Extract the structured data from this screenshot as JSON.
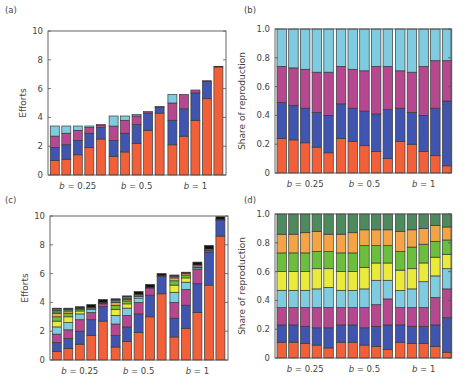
{
  "colors": [
    "#f2603a",
    "#3f55b0",
    "#b5488f",
    "#7fcbe0",
    "#eaea3a",
    "#6cbf3c",
    "#f5a445",
    "#4f8a5e",
    "#8a8a8a",
    "#111111"
  ],
  "chart_data": [
    {
      "id": "a",
      "panel_label": "(a)",
      "type": "bar",
      "stacked": true,
      "ylabel": "Efforts",
      "ylim": [
        0,
        10
      ],
      "yticks": [
        0,
        2,
        4,
        6,
        8,
        10
      ],
      "groups": [
        "b = 0.25",
        "b = 0.5",
        "b = 1"
      ],
      "bars_per_group": 5,
      "layers": 4,
      "values": [
        [
          [
            1.0,
            0.9,
            0.8,
            0.7
          ],
          [
            1.1,
            1.0,
            0.8,
            0.5
          ],
          [
            1.4,
            1.0,
            0.7,
            0.3
          ],
          [
            1.9,
            1.0,
            0.4,
            0.1
          ],
          [
            2.5,
            0.8,
            0.15,
            0.05
          ]
        ],
        [
          [
            1.3,
            1.1,
            1.0,
            0.7
          ],
          [
            1.6,
            1.3,
            0.9,
            0.3
          ],
          [
            2.2,
            1.3,
            0.6,
            0.1
          ],
          [
            3.1,
            1.2,
            0.1,
            0.0
          ],
          [
            4.3,
            0.4,
            0.05,
            0.0
          ]
        ],
        [
          [
            2.1,
            1.7,
            1.2,
            0.6
          ],
          [
            2.7,
            1.9,
            1.0,
            0.0
          ],
          [
            3.8,
            1.9,
            0.2,
            0.0
          ],
          [
            5.3,
            1.2,
            0.05,
            0.0
          ],
          [
            7.5,
            0.05,
            0.0,
            0.0
          ]
        ]
      ]
    },
    {
      "id": "b",
      "panel_label": "(b)",
      "type": "bar",
      "stacked": true,
      "ylabel": "Share of reproduction",
      "ylim": [
        0,
        1
      ],
      "yticks": [
        0,
        0.2,
        0.4,
        0.6,
        0.8,
        1.0
      ],
      "groups": [
        "b = 0.25",
        "b = 0.5",
        "b = 1"
      ],
      "bars_per_group": 5,
      "layers": 4,
      "values": [
        [
          [
            0.24,
            0.25,
            0.25,
            0.26
          ],
          [
            0.23,
            0.24,
            0.26,
            0.27
          ],
          [
            0.21,
            0.24,
            0.27,
            0.28
          ],
          [
            0.18,
            0.24,
            0.28,
            0.3
          ],
          [
            0.14,
            0.26,
            0.3,
            0.3
          ]
        ],
        [
          [
            0.24,
            0.24,
            0.26,
            0.26
          ],
          [
            0.22,
            0.23,
            0.27,
            0.28
          ],
          [
            0.19,
            0.24,
            0.28,
            0.29
          ],
          [
            0.15,
            0.26,
            0.33,
            0.26
          ],
          [
            0.1,
            0.34,
            0.3,
            0.26
          ]
        ],
        [
          [
            0.22,
            0.23,
            0.26,
            0.29
          ],
          [
            0.2,
            0.22,
            0.28,
            0.3
          ],
          [
            0.15,
            0.25,
            0.34,
            0.26
          ],
          [
            0.12,
            0.33,
            0.33,
            0.22
          ],
          [
            0.05,
            0.45,
            0.28,
            0.22
          ]
        ]
      ]
    },
    {
      "id": "c",
      "panel_label": "(c)",
      "type": "bar",
      "stacked": true,
      "ylabel": "Efforts",
      "ylim": [
        0,
        10
      ],
      "yticks": [
        0,
        2,
        4,
        6,
        8,
        10
      ],
      "groups": [
        "b = 0.25",
        "b = 0.5",
        "b = 1"
      ],
      "bars_per_group": 5,
      "layers": 10,
      "values": [
        [
          [
            0.6,
            0.6,
            0.6,
            0.5,
            0.4,
            0.3,
            0.25,
            0.2,
            0.1,
            0.05
          ],
          [
            0.8,
            0.7,
            0.6,
            0.5,
            0.4,
            0.25,
            0.15,
            0.1,
            0.05,
            0.05
          ],
          [
            1.1,
            0.9,
            0.8,
            0.4,
            0.2,
            0.1,
            0.05,
            0.05,
            0.05,
            0.05
          ],
          [
            1.7,
            1.1,
            0.5,
            0.2,
            0.05,
            0.0,
            0.0,
            0.0,
            0.1,
            0.2
          ],
          [
            2.7,
            1.0,
            0.2,
            0.05,
            0.0,
            0.0,
            0.0,
            0.0,
            0.05,
            0.2
          ]
        ],
        [
          [
            0.9,
            0.8,
            0.8,
            0.6,
            0.4,
            0.3,
            0.2,
            0.15,
            0.05,
            0.05
          ],
          [
            1.3,
            1.0,
            0.8,
            0.5,
            0.3,
            0.2,
            0.1,
            0.1,
            0.1,
            0.05
          ],
          [
            1.9,
            1.3,
            0.8,
            0.3,
            0.1,
            0.05,
            0.0,
            0.0,
            0.1,
            0.2
          ],
          [
            3.0,
            1.5,
            0.5,
            0.0,
            0.0,
            0.0,
            0.0,
            0.0,
            0.05,
            0.2
          ],
          [
            4.6,
            1.2,
            0.05,
            0.0,
            0.0,
            0.0,
            0.0,
            0.0,
            0.0,
            0.15
          ]
        ],
        [
          [
            1.6,
            1.3,
            1.1,
            0.7,
            0.5,
            0.3,
            0.2,
            0.1,
            0.05,
            0.05
          ],
          [
            2.2,
            1.6,
            1.1,
            0.5,
            0.3,
            0.2,
            0.1,
            0.05,
            0.0,
            0.05
          ],
          [
            3.3,
            2.0,
            1.0,
            0.1,
            0.05,
            0.0,
            0.0,
            0.0,
            0.15,
            0.2
          ],
          [
            5.2,
            2.3,
            0.1,
            0.0,
            0.0,
            0.0,
            0.0,
            0.0,
            0.1,
            0.25
          ],
          [
            8.6,
            1.1,
            0.05,
            0.0,
            0.0,
            0.0,
            0.0,
            0.0,
            0.0,
            0.2
          ]
        ]
      ]
    },
    {
      "id": "d",
      "panel_label": "(d)",
      "type": "bar",
      "stacked": true,
      "ylabel": "Share of reproduction",
      "ylim": [
        0,
        1
      ],
      "yticks": [
        0,
        0.2,
        0.4,
        0.6,
        0.8,
        1.0
      ],
      "groups": [
        "b = 0.25",
        "b = 0.5",
        "b = 1"
      ],
      "bars_per_group": 5,
      "layers": 8,
      "values": [
        [
          [
            0.11,
            0.12,
            0.12,
            0.12,
            0.13,
            0.13,
            0.13,
            0.14
          ],
          [
            0.11,
            0.12,
            0.12,
            0.12,
            0.13,
            0.13,
            0.13,
            0.14
          ],
          [
            0.1,
            0.12,
            0.13,
            0.12,
            0.13,
            0.13,
            0.14,
            0.13
          ],
          [
            0.09,
            0.12,
            0.14,
            0.13,
            0.14,
            0.12,
            0.14,
            0.12
          ],
          [
            0.07,
            0.14,
            0.14,
            0.14,
            0.13,
            0.12,
            0.12,
            0.14
          ]
        ],
        [
          [
            0.11,
            0.12,
            0.12,
            0.12,
            0.13,
            0.13,
            0.13,
            0.14
          ],
          [
            0.11,
            0.12,
            0.12,
            0.12,
            0.13,
            0.13,
            0.14,
            0.13
          ],
          [
            0.09,
            0.12,
            0.14,
            0.13,
            0.15,
            0.15,
            0.11,
            0.11
          ],
          [
            0.08,
            0.14,
            0.15,
            0.17,
            0.12,
            0.12,
            0.11,
            0.11
          ],
          [
            0.06,
            0.17,
            0.18,
            0.13,
            0.12,
            0.12,
            0.11,
            0.11
          ]
        ],
        [
          [
            0.11,
            0.12,
            0.12,
            0.12,
            0.14,
            0.13,
            0.14,
            0.12
          ],
          [
            0.1,
            0.12,
            0.13,
            0.13,
            0.14,
            0.15,
            0.12,
            0.11
          ],
          [
            0.1,
            0.12,
            0.13,
            0.18,
            0.13,
            0.13,
            0.11,
            0.1
          ],
          [
            0.08,
            0.15,
            0.19,
            0.15,
            0.13,
            0.11,
            0.11,
            0.08
          ],
          [
            0.04,
            0.24,
            0.2,
            0.14,
            0.1,
            0.1,
            0.09,
            0.09
          ]
        ]
      ]
    }
  ]
}
